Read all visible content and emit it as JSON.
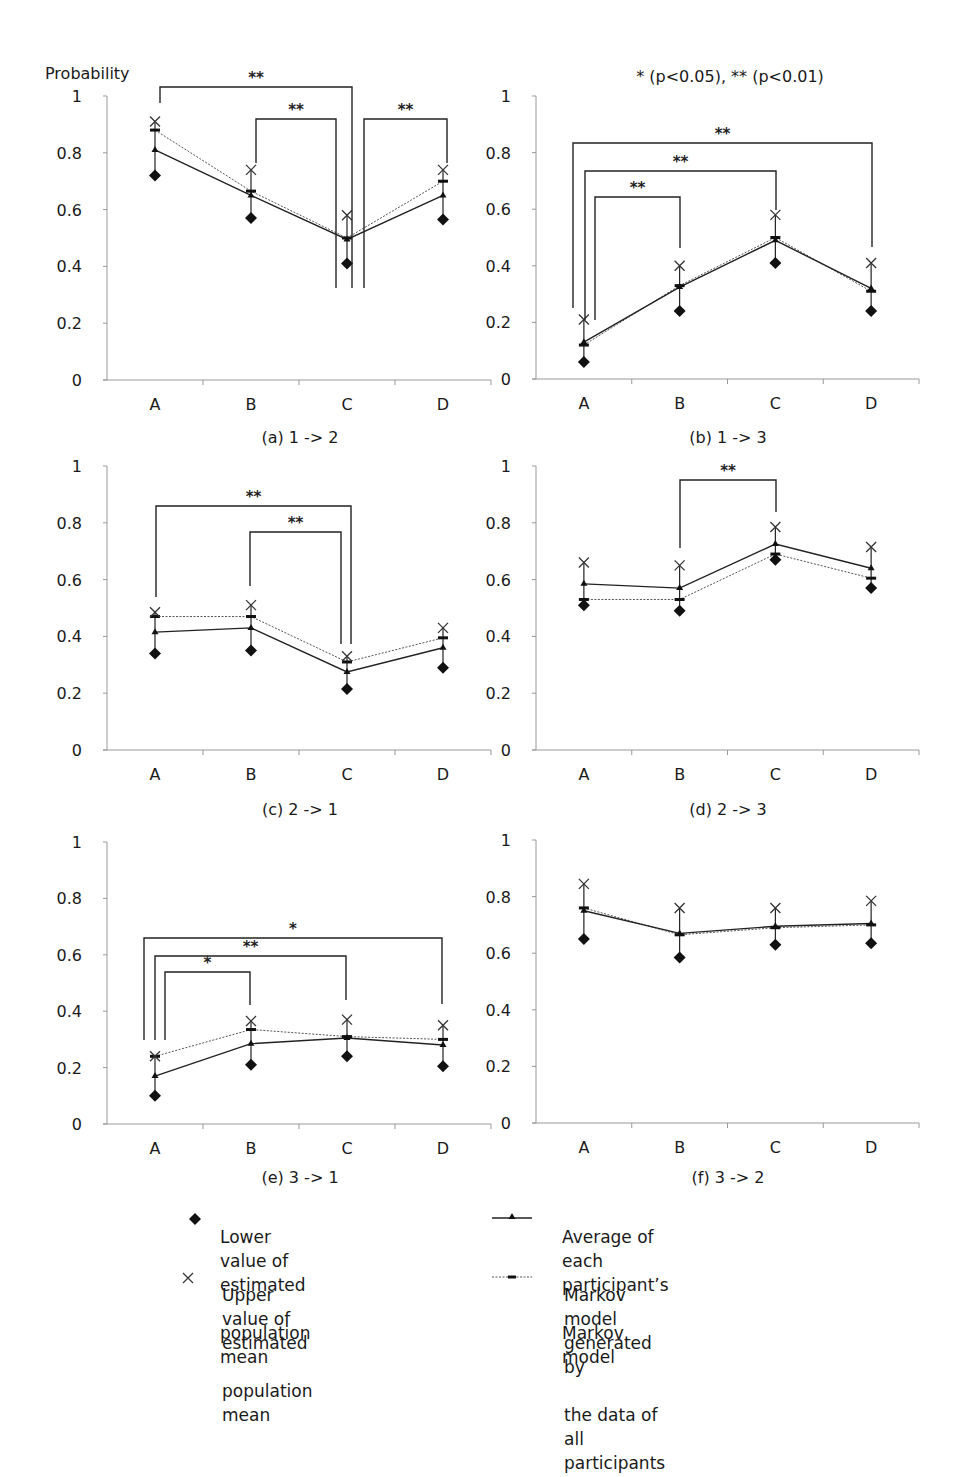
{
  "figure": {
    "y_axis_title": "Probability",
    "significance_note": "* (p<0.05), ** (p<0.01)"
  },
  "legend": {
    "items": [
      {
        "key": "lower",
        "marker": "filled-diamond",
        "label_line1": "Lower value of estimated",
        "label_line2": "population mean"
      },
      {
        "key": "upper",
        "marker": "x-cross",
        "label_line1": "Upper value of estimated",
        "label_line2": "population mean"
      },
      {
        "key": "avg",
        "marker": "solid-line-triangle",
        "label_line1": "Average of each participant’s",
        "label_line2": "Markov model"
      },
      {
        "key": "all",
        "marker": "dotted-line-dash",
        "label_line1": "Markov model generated by",
        "label_line2": "the data of all participants"
      }
    ]
  },
  "chart_data": [
    {
      "type": "line",
      "title": "(a) 1 -> 2",
      "xlabel": "",
      "ylabel": "Probability",
      "categories": [
        "A",
        "B",
        "C",
        "D"
      ],
      "ylim": [
        0,
        1
      ],
      "yticks": [
        "0",
        "0.2",
        "0.4",
        "0.6",
        "0.8",
        "1"
      ],
      "grid": false,
      "series": [
        {
          "name": "Lower value of estimated population mean",
          "key": "lower",
          "values": [
            0.72,
            0.57,
            0.41,
            0.565
          ]
        },
        {
          "name": "Upper value of estimated population mean",
          "key": "upper",
          "values": [
            0.91,
            0.74,
            0.58,
            0.74
          ]
        },
        {
          "name": "Average of each participant's Markov model",
          "key": "avg",
          "values": [
            0.81,
            0.65,
            0.495,
            0.65
          ]
        },
        {
          "name": "Markov model generated by the data of all participants",
          "key": "all",
          "values": [
            0.88,
            0.665,
            0.5,
            0.7
          ]
        }
      ],
      "significance": [
        {
          "from": "A",
          "to": "C",
          "label": "**"
        },
        {
          "from": "B",
          "to": "C",
          "label": "**"
        },
        {
          "from": "C",
          "to": "D",
          "label": "**"
        }
      ]
    },
    {
      "type": "line",
      "title": "(b) 1 -> 3",
      "xlabel": "",
      "ylabel": "",
      "categories": [
        "A",
        "B",
        "C",
        "D"
      ],
      "ylim": [
        0,
        1
      ],
      "yticks": [
        "0",
        "0.2",
        "0.4",
        "0.6",
        "0.8",
        "1"
      ],
      "grid": false,
      "series": [
        {
          "name": "Lower value of estimated population mean",
          "key": "lower",
          "values": [
            0.06,
            0.24,
            0.41,
            0.24
          ]
        },
        {
          "name": "Upper value of estimated population mean",
          "key": "upper",
          "values": [
            0.21,
            0.4,
            0.58,
            0.41
          ]
        },
        {
          "name": "Average of each participant's Markov model",
          "key": "avg",
          "values": [
            0.13,
            0.325,
            0.49,
            0.32
          ]
        },
        {
          "name": "Markov model generated by the data of all participants",
          "key": "all",
          "values": [
            0.12,
            0.33,
            0.5,
            0.31
          ]
        }
      ],
      "significance": [
        {
          "from": "A",
          "to": "D",
          "label": "**"
        },
        {
          "from": "A",
          "to": "C",
          "label": "**"
        },
        {
          "from": "A",
          "to": "B",
          "label": "**"
        }
      ]
    },
    {
      "type": "line",
      "title": "(c) 2 -> 1",
      "xlabel": "",
      "ylabel": "",
      "categories": [
        "A",
        "B",
        "C",
        "D"
      ],
      "ylim": [
        0,
        1
      ],
      "yticks": [
        "0",
        "0.2",
        "0.4",
        "0.6",
        "0.8",
        "1"
      ],
      "grid": false,
      "series": [
        {
          "name": "Lower value of estimated population mean",
          "key": "lower",
          "values": [
            0.34,
            0.35,
            0.215,
            0.29
          ]
        },
        {
          "name": "Upper value of estimated population mean",
          "key": "upper",
          "values": [
            0.485,
            0.51,
            0.33,
            0.43
          ]
        },
        {
          "name": "Average of each participant's Markov model",
          "key": "avg",
          "values": [
            0.415,
            0.43,
            0.275,
            0.36
          ]
        },
        {
          "name": "Markov model generated by the data of all participants",
          "key": "all",
          "values": [
            0.47,
            0.47,
            0.31,
            0.395
          ]
        }
      ],
      "significance": [
        {
          "from": "A",
          "to": "C",
          "label": "**"
        },
        {
          "from": "B",
          "to": "C",
          "label": "**"
        }
      ]
    },
    {
      "type": "line",
      "title": "(d) 2 -> 3",
      "xlabel": "",
      "ylabel": "",
      "categories": [
        "A",
        "B",
        "C",
        "D"
      ],
      "ylim": [
        0,
        1
      ],
      "yticks": [
        "0",
        "0.2",
        "0.4",
        "0.6",
        "0.8",
        "1"
      ],
      "grid": false,
      "series": [
        {
          "name": "Lower value of estimated population mean",
          "key": "lower",
          "values": [
            0.51,
            0.49,
            0.67,
            0.57
          ]
        },
        {
          "name": "Upper value of estimated population mean",
          "key": "upper",
          "values": [
            0.66,
            0.65,
            0.785,
            0.715
          ]
        },
        {
          "name": "Average of each participant's Markov model",
          "key": "avg",
          "values": [
            0.585,
            0.57,
            0.725,
            0.64
          ]
        },
        {
          "name": "Markov model generated by the data of all participants",
          "key": "all",
          "values": [
            0.53,
            0.53,
            0.69,
            0.605
          ]
        }
      ],
      "significance": [
        {
          "from": "B",
          "to": "C",
          "label": "**"
        }
      ]
    },
    {
      "type": "line",
      "title": "(e) 3 -> 1",
      "xlabel": "",
      "ylabel": "",
      "categories": [
        "A",
        "B",
        "C",
        "D"
      ],
      "ylim": [
        0,
        1
      ],
      "yticks": [
        "0",
        "0.2",
        "0.4",
        "0.6",
        "0.8",
        "1"
      ],
      "grid": false,
      "series": [
        {
          "name": "Lower value of estimated population mean",
          "key": "lower",
          "values": [
            0.1,
            0.21,
            0.24,
            0.205
          ]
        },
        {
          "name": "Upper value of estimated population mean",
          "key": "upper",
          "values": [
            0.24,
            0.365,
            0.37,
            0.35
          ]
        },
        {
          "name": "Average of each participant's Markov model",
          "key": "avg",
          "values": [
            0.17,
            0.285,
            0.305,
            0.28
          ]
        },
        {
          "name": "Markov model generated by the data of all participants",
          "key": "all",
          "values": [
            0.24,
            0.335,
            0.31,
            0.3
          ]
        }
      ],
      "significance": [
        {
          "from": "A",
          "to": "D",
          "label": "*"
        },
        {
          "from": "A",
          "to": "C",
          "label": "**"
        },
        {
          "from": "A",
          "to": "B",
          "label": "*"
        }
      ]
    },
    {
      "type": "line",
      "title": "(f) 3 -> 2",
      "xlabel": "",
      "ylabel": "",
      "categories": [
        "A",
        "B",
        "C",
        "D"
      ],
      "ylim": [
        0,
        1
      ],
      "yticks": [
        "0",
        "0.2",
        "0.4",
        "0.6",
        "0.8",
        "1"
      ],
      "grid": false,
      "series": [
        {
          "name": "Lower value of estimated population mean",
          "key": "lower",
          "values": [
            0.65,
            0.585,
            0.63,
            0.635
          ]
        },
        {
          "name": "Upper value of estimated population mean",
          "key": "upper",
          "values": [
            0.845,
            0.76,
            0.76,
            0.785
          ]
        },
        {
          "name": "Average of each participant's Markov model",
          "key": "avg",
          "values": [
            0.75,
            0.67,
            0.695,
            0.705
          ]
        },
        {
          "name": "Markov model generated by the data of all participants",
          "key": "all",
          "values": [
            0.76,
            0.665,
            0.69,
            0.7
          ]
        }
      ],
      "significance": []
    }
  ]
}
